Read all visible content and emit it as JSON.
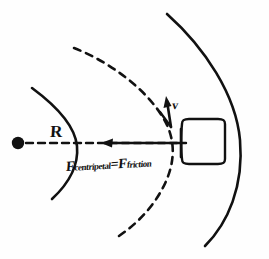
{
  "figure": {
    "domain": "diagram",
    "background_color": "#fefefe",
    "ink_color": "#111111",
    "width": 269,
    "height": 259
  },
  "labels": {
    "radius": "R",
    "velocity": "v",
    "force_equation_prefix": "F",
    "force_equation_sub1": "centripetal",
    "force_equation_equals": "=F",
    "force_equation_sub2": "friction"
  },
  "elements": {
    "center_dot_name": "center-point-dot",
    "radius_line_name": "radius-dashed-line",
    "inner_arc_name": "inner-road-edge-arc",
    "outer_arc_name": "outer-road-edge-arc",
    "path_arc_name": "circular-path-dashed-arc",
    "car_box_name": "car-box",
    "force_arrow_name": "centripetal-force-arrow",
    "velocity_arrow_name": "velocity-vector-arrow"
  },
  "geometry": {
    "center_dot": {
      "cx": 18,
      "cy": 143,
      "r": 6
    },
    "radius_line": {
      "x1": 24,
      "y1": 143,
      "x2": 200,
      "y2": 143
    },
    "car_box": {
      "x": 180,
      "y": 119,
      "width": 46,
      "height": 45
    },
    "force_arrow": {
      "x_tail": 180,
      "y": 143,
      "x_head": 103
    },
    "velocity_arrow": {
      "x_tail": 171,
      "y_tail": 126,
      "x_head": 166,
      "y_head": 100
    }
  }
}
